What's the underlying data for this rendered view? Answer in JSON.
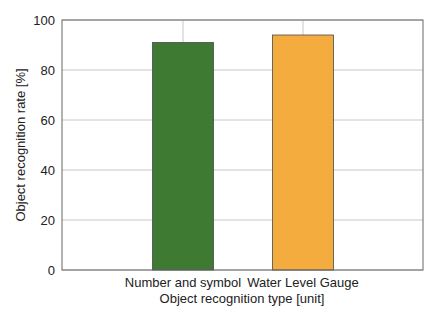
{
  "chart_data": {
    "type": "bar",
    "title": "",
    "categories": [
      "Number and symbol",
      "Water Level Gauge"
    ],
    "values": [
      91,
      94
    ],
    "colors": [
      "#3f7a32",
      "#f5ac3e"
    ],
    "xlabel": "Object recognition type [unit]",
    "ylabel": "Object recognition rate [%]",
    "ylim": [
      0,
      100
    ],
    "yticks": [
      0,
      20,
      40,
      60,
      80,
      100
    ],
    "grid": true,
    "legend": null
  }
}
